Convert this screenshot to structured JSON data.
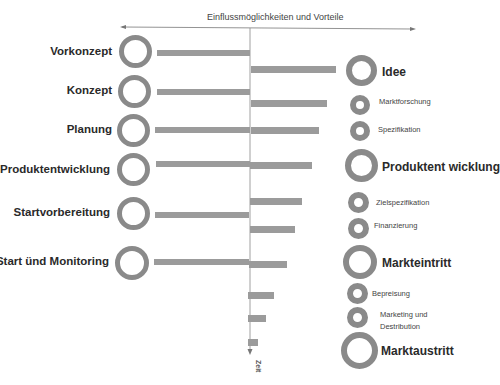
{
  "title": "Einflussmöglichkeiten und Vorteile",
  "time_axis_label": "Zeit",
  "colors": {
    "ring": "#8a8a8a",
    "bar": "#9b9b9b",
    "axis": "#777777"
  },
  "left_phases": [
    {
      "label": "Vorkonzept"
    },
    {
      "label": "Konzept"
    },
    {
      "label": "Planung"
    },
    {
      "label": "Produktentwicklung"
    },
    {
      "label": "Startvorbereitung"
    },
    {
      "label": "Start ünd Monitoring"
    }
  ],
  "right_phases": [
    {
      "label": "Idee",
      "type": "major"
    },
    {
      "label": "Marktforschung",
      "type": "minor"
    },
    {
      "label": "Spezifikation",
      "type": "minor"
    },
    {
      "label": "Produktent wicklung",
      "type": "major"
    },
    {
      "label": "Zielspezifikation",
      "type": "minor"
    },
    {
      "label": "Finanzierung",
      "type": "minor"
    },
    {
      "label": "Markteintritt",
      "type": "major"
    },
    {
      "label": "Bepreisung",
      "type": "minor"
    },
    {
      "label": "Marketing und",
      "label2": "Destribution",
      "type": "minor"
    },
    {
      "label": "Marktaustritt",
      "type": "major"
    }
  ]
}
